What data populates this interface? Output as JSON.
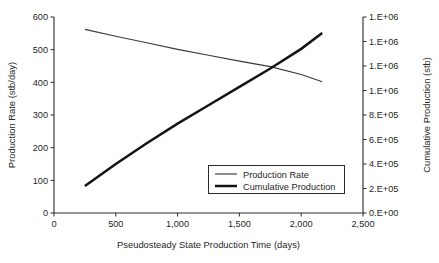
{
  "chart_data": {
    "type": "line",
    "title": "",
    "xlabel": "Pseudosteady State Production Time (days)",
    "ylabel": "Production Rate (stb/day)",
    "y2label": "Cumulative Production (stb)",
    "xlim": [
      0,
      2500
    ],
    "ylim": [
      0,
      600
    ],
    "y2lim": [
      0,
      1600000
    ],
    "grid": false,
    "legend_position": "inside-lower-right",
    "xticks": [
      0,
      500,
      1000,
      1500,
      2000,
      2500
    ],
    "xtick_labels": [
      "0",
      "500",
      "1,000",
      "1,500",
      "2,000",
      "2,500"
    ],
    "yticks": [
      0,
      100,
      200,
      300,
      400,
      500,
      600
    ],
    "ytick_labels": [
      "0",
      "100",
      "200",
      "300",
      "400",
      "500",
      "600"
    ],
    "y2ticks": [
      0,
      200000,
      400000,
      600000,
      800000,
      1000000,
      1200000,
      1400000,
      1600000
    ],
    "y2tick_labels": [
      "0.E+00",
      "2.E+05",
      "4.E+05",
      "6.E+05",
      "8.E+05",
      "1.E+06",
      "1.E+06",
      "1.E+06",
      "1.E+06"
    ],
    "series": [
      {
        "name": "Production Rate",
        "axis": "left",
        "style": "thin",
        "x": [
          250,
          500,
          750,
          1000,
          1250,
          1500,
          1750,
          2000,
          2170
        ],
        "values": [
          562,
          541,
          521,
          501,
          483,
          465,
          448,
          424,
          402
        ]
      },
      {
        "name": "Cumulative Production",
        "axis": "right",
        "style": "thick",
        "x": [
          250,
          500,
          750,
          1000,
          1250,
          1500,
          1750,
          2000,
          2170
        ],
        "values": [
          220000,
          400000,
          570000,
          730000,
          880000,
          1030000,
          1180000,
          1340000,
          1470000
        ]
      }
    ],
    "legend": [
      {
        "label": "Production Rate",
        "style": "thin"
      },
      {
        "label": "Cumulative Production",
        "style": "thick"
      }
    ]
  }
}
